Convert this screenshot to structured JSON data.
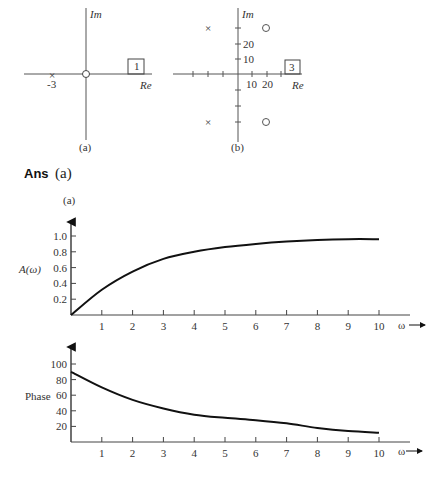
{
  "pole_zero_plots": [
    {
      "caption": "(a)",
      "axis_labels": {
        "im": "Im",
        "re": "Re"
      },
      "poles": [
        {
          "re": -3,
          "im": 0,
          "label": "-3"
        }
      ],
      "zeros": [
        {
          "re": 0,
          "im": 0
        }
      ],
      "gain_box": "1"
    },
    {
      "caption": "(b)",
      "axis_labels": {
        "im": "Im",
        "re": "Re"
      },
      "tick_labels_re": [
        "10",
        "20"
      ],
      "tick_labels_im": [
        "10",
        "20"
      ],
      "poles": [
        {
          "re": -20,
          "im": 30
        },
        {
          "re": -20,
          "im": -30
        }
      ],
      "zeros": [
        {
          "re": 20,
          "im": 30
        },
        {
          "re": 20,
          "im": -30
        }
      ],
      "gain_box": "3"
    }
  ],
  "answer": {
    "prefix": "Ans",
    "part": "(a)"
  },
  "chart_data": [
    {
      "type": "line",
      "title": "(a)",
      "xlabel": "ω",
      "ylabel": "A(ω)",
      "x_ticks": [
        "1",
        "2",
        "3",
        "4",
        "5",
        "6",
        "7",
        "8",
        "9",
        "10"
      ],
      "y_ticks": [
        "0.2",
        "0.4",
        "0.6",
        "0.8",
        "1.0"
      ],
      "xlim": [
        0,
        10
      ],
      "ylim": [
        0,
        1.0
      ],
      "grid": false,
      "x": [
        0,
        1,
        2,
        3,
        4,
        5,
        6,
        7,
        8,
        9,
        10
      ],
      "series": [
        {
          "name": "A(ω)",
          "values": [
            0,
            0.32,
            0.55,
            0.71,
            0.8,
            0.86,
            0.9,
            0.93,
            0.95,
            0.96,
            0.96
          ]
        }
      ]
    },
    {
      "type": "line",
      "title": "",
      "xlabel": "ω",
      "ylabel": "Phase",
      "x_ticks": [
        "1",
        "2",
        "3",
        "4",
        "5",
        "6",
        "7",
        "8",
        "9",
        "10"
      ],
      "y_ticks": [
        "20",
        "40",
        "60",
        "80",
        "100"
      ],
      "xlim": [
        0,
        10
      ],
      "ylim": [
        0,
        100
      ],
      "grid": false,
      "x": [
        0,
        1,
        2,
        3,
        4,
        5,
        6,
        7,
        8,
        9,
        10
      ],
      "series": [
        {
          "name": "Phase",
          "values": [
            90,
            70,
            54,
            43,
            35,
            31,
            28,
            24,
            18,
            14,
            12
          ]
        }
      ]
    }
  ]
}
